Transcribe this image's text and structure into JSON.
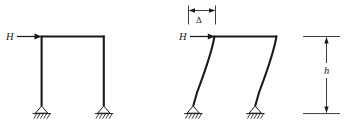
{
  "figure": {
    "stroke_color": "#1a1a1a",
    "background_color": "#ffffff"
  },
  "labels": {
    "load_left": "H",
    "load_right": "H",
    "displacement": "Δ",
    "height": "h"
  },
  "frames": [
    {
      "name": "undeformed-frame",
      "state": "undeformed",
      "bays": 1,
      "support_type": "pinned",
      "columns": 2,
      "load_label": "H",
      "load_direction": "horizontal-right"
    },
    {
      "name": "deformed-frame",
      "state": "deformed-sidesway",
      "bays": 1,
      "support_type": "pinned",
      "columns": 2,
      "load_label": "H",
      "load_direction": "horizontal-right",
      "displacement_label": "Δ",
      "height_label": "h"
    }
  ],
  "dimensions": [
    {
      "name": "delta-dimension",
      "label": "Δ",
      "orientation": "horizontal",
      "measures": "lateral displacement of frame top"
    },
    {
      "name": "height-dimension",
      "label": "h",
      "orientation": "vertical",
      "measures": "storey height from support to beam"
    }
  ]
}
